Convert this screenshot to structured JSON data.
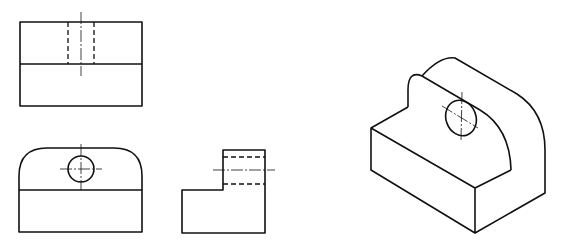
{
  "figure": {
    "views": [
      {
        "id": "top-view",
        "label": ""
      },
      {
        "id": "front-view",
        "label": ""
      },
      {
        "id": "side-view",
        "label": ""
      },
      {
        "id": "isometric-view",
        "label": ""
      }
    ],
    "line_color": "#111111",
    "background": "#ffffff"
  }
}
